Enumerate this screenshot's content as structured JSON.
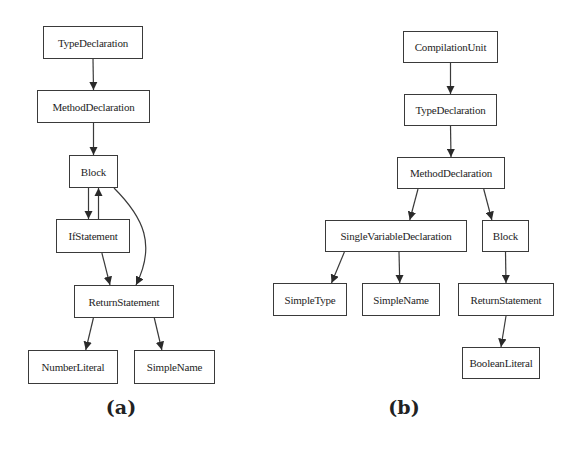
{
  "diagrams": [
    {
      "id": "a",
      "caption": "(a)",
      "nodes": [
        {
          "id": "a_type",
          "label": "TypeDeclaration",
          "box": [
            43,
            26,
            100,
            33
          ]
        },
        {
          "id": "a_method",
          "label": "MethodDeclaration",
          "box": [
            37,
            90,
            113,
            33
          ]
        },
        {
          "id": "a_block",
          "label": "Block",
          "box": [
            69,
            155,
            49,
            33
          ]
        },
        {
          "id": "a_if",
          "label": "IfStatement",
          "box": [
            56,
            219,
            74,
            34
          ]
        },
        {
          "id": "a_return",
          "label": "ReturnStatement",
          "box": [
            74,
            285,
            100,
            33
          ]
        },
        {
          "id": "a_number",
          "label": "NumberLiteral",
          "box": [
            28,
            350,
            90,
            34
          ]
        },
        {
          "id": "a_simplename",
          "label": "SimpleName",
          "box": [
            134,
            350,
            81,
            34
          ]
        }
      ],
      "edges": [
        {
          "from": "a_type",
          "to": "a_method"
        },
        {
          "from": "a_method",
          "to": "a_block"
        },
        {
          "from": "a_block",
          "to": "a_if"
        },
        {
          "from": "a_if",
          "to": "a_block"
        },
        {
          "from": "a_block",
          "to": "a_return",
          "curved": true
        },
        {
          "from": "a_if",
          "to": "a_return"
        },
        {
          "from": "a_return",
          "to": "a_number"
        },
        {
          "from": "a_return",
          "to": "a_simplename"
        }
      ]
    },
    {
      "id": "b",
      "caption": "(b)",
      "nodes": [
        {
          "id": "b_cu",
          "label": "CompilationUnit",
          "box": [
            403,
            31,
            95,
            32
          ]
        },
        {
          "id": "b_type",
          "label": "TypeDeclaration",
          "box": [
            404,
            94,
            93,
            32
          ]
        },
        {
          "id": "b_method",
          "label": "MethodDeclaration",
          "box": [
            397,
            157,
            108,
            32
          ]
        },
        {
          "id": "b_svd",
          "label": "SingleVariableDeclaration",
          "box": [
            325,
            220,
            142,
            32
          ]
        },
        {
          "id": "b_block",
          "label": "Block",
          "box": [
            482,
            220,
            47,
            32
          ]
        },
        {
          "id": "b_simpletype",
          "label": "SimpleType",
          "box": [
            273,
            283,
            74,
            33
          ]
        },
        {
          "id": "b_simplename",
          "label": "SimpleName",
          "box": [
            362,
            283,
            78,
            33
          ]
        },
        {
          "id": "b_return",
          "label": "ReturnStatement",
          "box": [
            458,
            283,
            96,
            33
          ]
        },
        {
          "id": "b_boolean",
          "label": "BooleanLiteral",
          "box": [
            462,
            347,
            78,
            32
          ]
        }
      ],
      "edges": [
        {
          "from": "b_cu",
          "to": "b_type"
        },
        {
          "from": "b_type",
          "to": "b_method"
        },
        {
          "from": "b_method",
          "to": "b_svd"
        },
        {
          "from": "b_method",
          "to": "b_block"
        },
        {
          "from": "b_svd",
          "to": "b_simpletype"
        },
        {
          "from": "b_svd",
          "to": "b_simplename"
        },
        {
          "from": "b_block",
          "to": "b_return"
        },
        {
          "from": "b_return",
          "to": "b_boolean"
        }
      ]
    }
  ],
  "captions": {
    "a": "(a)",
    "b": "(b)"
  },
  "caption_positions": {
    "a": [
      121,
      396
    ],
    "b": [
      404,
      396
    ]
  },
  "colors": {
    "stroke": "#3a3a3a",
    "text": "#1e1e1e",
    "background": "#ffffff"
  }
}
